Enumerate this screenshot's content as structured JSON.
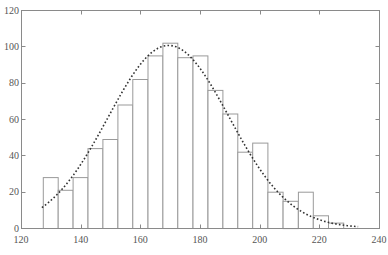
{
  "chart_data": {
    "type": "bar",
    "title": "",
    "xlabel": "",
    "ylabel": "",
    "xlim": [
      120,
      240
    ],
    "ylim": [
      0,
      120
    ],
    "xticks": [
      120,
      140,
      160,
      180,
      200,
      220,
      240
    ],
    "yticks": [
      0,
      20,
      40,
      60,
      80,
      100,
      120
    ],
    "grid": false,
    "legend": null,
    "histogram": {
      "bin_start": 127.3,
      "bin_width": 5.03,
      "bin_edges": [
        127.3,
        132.3,
        137.3,
        142.3,
        147.3,
        152.3,
        157.3,
        162.4,
        167.4,
        172.4,
        177.5,
        182.5,
        187.5,
        192.5,
        197.5,
        202.6,
        207.7,
        212.8,
        217.8,
        222.9,
        228.0
      ],
      "counts": [
        28,
        21,
        28,
        44,
        49,
        68,
        82,
        95,
        102,
        94,
        95,
        76,
        63,
        42,
        47,
        20,
        15,
        20,
        7,
        3
      ]
    },
    "series": [
      {
        "name": "histogram",
        "type": "bar",
        "values": [
          28,
          21,
          28,
          44,
          49,
          68,
          82,
          95,
          102,
          94,
          95,
          76,
          63,
          42,
          47,
          20,
          15,
          20,
          7,
          3
        ]
      },
      {
        "name": "normal fit",
        "type": "line",
        "style": "dotted",
        "mean": 169.5,
        "sigma": 20.3,
        "peak": 100.5,
        "x_range": [
          127,
          233
        ],
        "points": [
          [
            127,
            10.5
          ],
          [
            135,
            23.5
          ],
          [
            140,
            35
          ],
          [
            145,
            48
          ],
          [
            150,
            63
          ],
          [
            155,
            77
          ],
          [
            160,
            89
          ],
          [
            165,
            97.5
          ],
          [
            170,
            100.5
          ],
          [
            175,
            98
          ],
          [
            180,
            90
          ],
          [
            185,
            79
          ],
          [
            190,
            65
          ],
          [
            195,
            51
          ],
          [
            200,
            38
          ],
          [
            205,
            27
          ],
          [
            210,
            17.5
          ],
          [
            215,
            11
          ],
          [
            220,
            6.4
          ],
          [
            225,
            3.5
          ],
          [
            230,
            1.7
          ],
          [
            233,
            1.1
          ]
        ]
      }
    ],
    "colors": {
      "bar_fill": "#ffffff",
      "bar_edge": "#9a9a9a",
      "fit_line": "#333333",
      "axis": "#8a8a8a",
      "tick_label": "#555555"
    }
  },
  "axes": {
    "x_tick_labels": [
      "120",
      "140",
      "160",
      "180",
      "200",
      "220",
      "240"
    ],
    "y_tick_labels": [
      "0",
      "20",
      "40",
      "60",
      "80",
      "100",
      "120"
    ]
  }
}
